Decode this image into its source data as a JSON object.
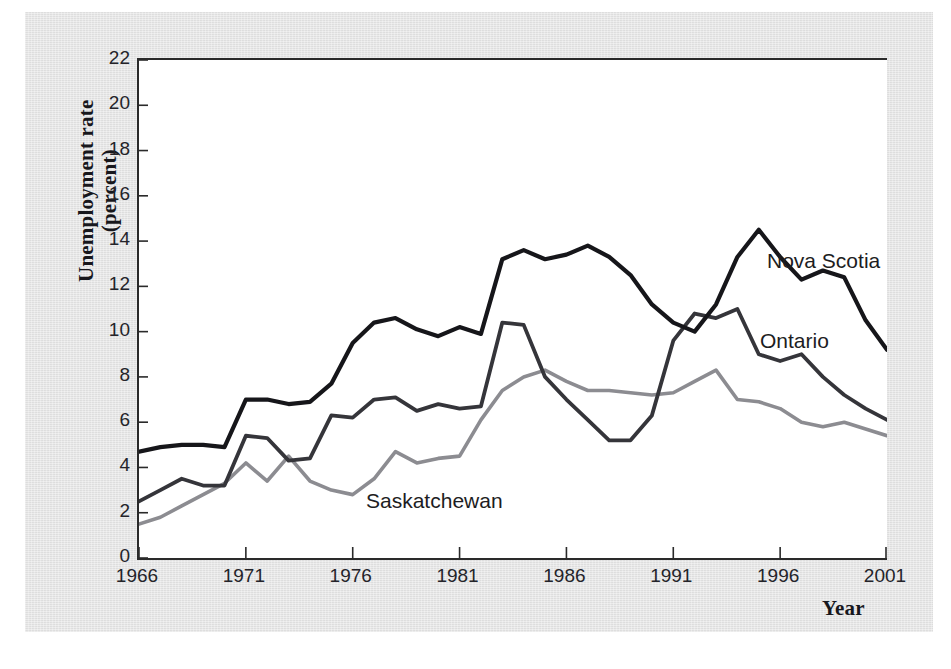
{
  "chart_data": {
    "type": "line",
    "title": "",
    "xlabel": "Year",
    "ylabel": "Unemployment rate (percent)",
    "ylabel_lines": [
      "Unemployment rate",
      "(percent)"
    ],
    "xlim": [
      1966,
      2001
    ],
    "ylim": [
      0,
      22
    ],
    "ytick_values": [
      0,
      2,
      4,
      6,
      8,
      10,
      12,
      14,
      16,
      18,
      20,
      22
    ],
    "ytick_labels": [
      "0",
      "2",
      "4",
      "6",
      "8",
      "10",
      "12",
      "14",
      "16",
      "18",
      "20",
      "22"
    ],
    "xtick_values": [
      1966,
      1971,
      1976,
      1981,
      1986,
      1991,
      1996,
      2001
    ],
    "xtick_labels": [
      "1966",
      "1971",
      "1976",
      "1981",
      "1986",
      "1991",
      "1996",
      "2001"
    ],
    "grid": false,
    "legend_position": "inline-annotations",
    "x": [
      1966,
      1967,
      1968,
      1969,
      1970,
      1971,
      1972,
      1973,
      1974,
      1975,
      1976,
      1977,
      1978,
      1979,
      1980,
      1981,
      1982,
      1983,
      1984,
      1985,
      1986,
      1987,
      1988,
      1989,
      1990,
      1991,
      1992,
      1993,
      1994,
      1995,
      1996,
      1997,
      1998,
      1999,
      2000,
      2001
    ],
    "series": [
      {
        "name": "Nova Scotia",
        "color": "#16161a",
        "values": [
          4.7,
          4.9,
          5.0,
          5.0,
          4.9,
          7.0,
          7.0,
          6.8,
          6.9,
          7.7,
          9.5,
          10.4,
          10.6,
          10.1,
          9.8,
          10.2,
          9.9,
          13.2,
          13.6,
          13.2,
          13.4,
          13.8,
          13.3,
          12.5,
          11.2,
          10.4,
          10.0,
          11.2,
          13.3,
          14.5,
          13.3,
          12.3,
          12.7,
          12.4,
          10.5,
          9.2
        ]
      },
      {
        "name": "Ontario",
        "color": "#35353a",
        "values": [
          2.5,
          3.0,
          3.5,
          3.2,
          3.2,
          5.4,
          5.3,
          4.3,
          4.4,
          6.3,
          6.2,
          7.0,
          7.1,
          6.5,
          6.8,
          6.6,
          6.7,
          10.4,
          10.3,
          8.0,
          7.0,
          6.1,
          5.2,
          5.2,
          6.3,
          9.6,
          10.8,
          10.6,
          11.0,
          9.0,
          8.7,
          9.0,
          8.0,
          7.2,
          6.6,
          6.1
        ]
      },
      {
        "name": "Saskatchewan",
        "color": "#8c8c91",
        "values": [
          1.5,
          1.8,
          2.3,
          2.8,
          3.3,
          4.2,
          3.4,
          4.5,
          3.4,
          3.0,
          2.8,
          3.5,
          4.7,
          4.2,
          4.4,
          4.5,
          6.1,
          7.4,
          8.0,
          8.3,
          7.8,
          7.4,
          7.4,
          7.3,
          7.2,
          7.3,
          7.8,
          8.3,
          7.0,
          6.9,
          6.6,
          6.0,
          5.8,
          6.0,
          5.7,
          5.4
        ]
      }
    ],
    "annotations": [
      {
        "text": "Nova Scotia",
        "series": "Nova Scotia"
      },
      {
        "text": "Ontario",
        "series": "Ontario"
      },
      {
        "text": "Saskatchewan",
        "series": "Saskatchewan"
      }
    ]
  }
}
